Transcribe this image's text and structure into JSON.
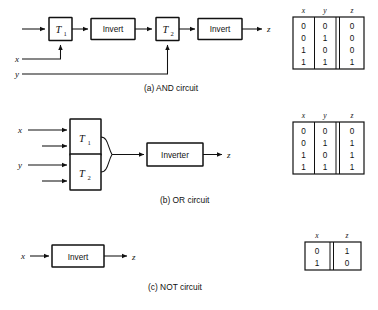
{
  "figure": {
    "signals": {
      "x": "x",
      "y": "y",
      "z": "z"
    }
  },
  "circuits": [
    {
      "id": "and",
      "caption": "(a)  AND circuit",
      "blocks": [
        {
          "name": "t1",
          "label": "T",
          "sub": "1"
        },
        {
          "name": "invert1",
          "label": "Invert"
        },
        {
          "name": "t2",
          "label": "T",
          "sub": "2"
        },
        {
          "name": "invert2",
          "label": "Invert"
        }
      ],
      "inputs": [
        "x",
        "y"
      ],
      "output": "z"
    },
    {
      "id": "or",
      "caption": "(b)  OR circuit",
      "blocks": [
        {
          "name": "t1",
          "label": "T",
          "sub": "1"
        },
        {
          "name": "t2",
          "label": "T",
          "sub": "2"
        },
        {
          "name": "inverter",
          "label": "Inverter"
        }
      ],
      "inputs": [
        "x",
        "y"
      ],
      "output": "z"
    },
    {
      "id": "not",
      "caption": "(c)  NOT circuit",
      "blocks": [
        {
          "name": "invert",
          "label": "Invert"
        }
      ],
      "inputs": [
        "x"
      ],
      "output": "z"
    }
  ],
  "tables": [
    {
      "id": "and-table",
      "headers": [
        "x",
        "y",
        "z"
      ],
      "rows": [
        [
          "0",
          "0",
          "0"
        ],
        [
          "0",
          "1",
          "0"
        ],
        [
          "1",
          "0",
          "0"
        ],
        [
          "1",
          "1",
          "1"
        ]
      ]
    },
    {
      "id": "or-table",
      "headers": [
        "x",
        "y",
        "z"
      ],
      "rows": [
        [
          "0",
          "0",
          "0"
        ],
        [
          "0",
          "1",
          "1"
        ],
        [
          "1",
          "0",
          "1"
        ],
        [
          "1",
          "1",
          "1"
        ]
      ]
    },
    {
      "id": "not-table",
      "headers": [
        "x",
        "z"
      ],
      "rows": [
        [
          "0",
          "1"
        ],
        [
          "1",
          "0"
        ]
      ]
    }
  ]
}
